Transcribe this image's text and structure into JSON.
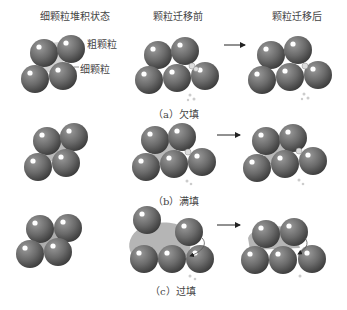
{
  "headers": {
    "col1": "细颗粒堆积状态",
    "col2": "颗粒迁移前",
    "col3": "颗粒迁移后"
  },
  "annotations": {
    "coarse": "粗颗粒",
    "fine": "细颗粒"
  },
  "rows": [
    {
      "caption": "（a）欠填"
    },
    {
      "caption": "（b）满填"
    },
    {
      "caption": "（c）过填"
    }
  ],
  "colors": {
    "sphere": "#6e6e6e",
    "sphere_dark": "#3f3f3f",
    "fines": "#a9a9a9",
    "arrow": "#222222"
  }
}
